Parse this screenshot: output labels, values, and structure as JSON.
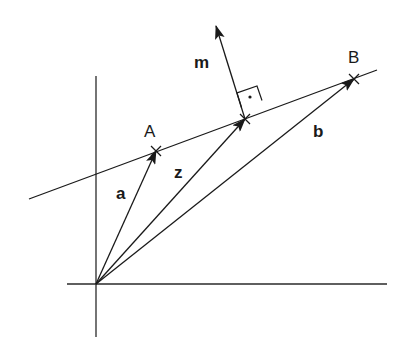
{
  "diagram": {
    "type": "vector-geometry",
    "colors": {
      "stroke": "#1a1a1a",
      "background": "#ffffff"
    },
    "points": {
      "A": {
        "label": "A"
      },
      "B": {
        "label": "B"
      }
    },
    "vectors": {
      "a": {
        "label": "a"
      },
      "z": {
        "label": "z"
      },
      "b": {
        "label": "b"
      },
      "m": {
        "label": "m"
      }
    },
    "annotations": {
      "right_angle_marker": "right-angle square with dot"
    }
  }
}
